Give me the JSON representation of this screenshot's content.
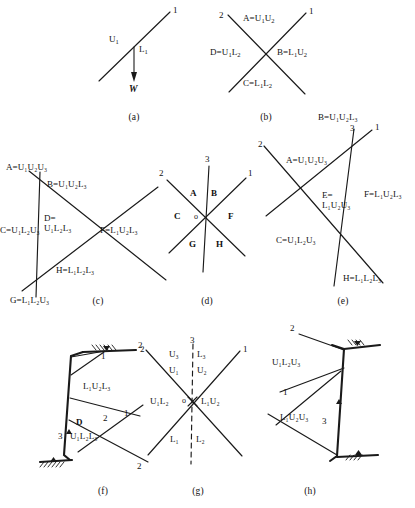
{
  "figure": {
    "stroke_color": "#1a1a1a",
    "background": "#ffffff",
    "panels": [
      {
        "id": "a",
        "caption": "(a)",
        "line_numbers": [
          "1"
        ],
        "labels": [
          "U1",
          "L1",
          "W"
        ]
      },
      {
        "id": "b",
        "caption": "(b)",
        "line_numbers": [
          "1",
          "2"
        ],
        "labels": [
          "A=U1U2",
          "B=L1U2",
          "C=L1L2",
          "D=U1L2"
        ]
      },
      {
        "id": "c",
        "caption": "(c)",
        "line_numbers": [],
        "labels": [
          "A=U1U2U3",
          "B=U1U2L3",
          "C=U1L2U3",
          "D= U1L2L3",
          "F=L1U2L3",
          "G=L1L2U3",
          "H=L1L2L3"
        ]
      },
      {
        "id": "d",
        "caption": "(d)",
        "line_numbers": [
          "1",
          "2",
          "3"
        ],
        "labels": [
          "o",
          "A",
          "B",
          "C",
          "F",
          "G",
          "H"
        ]
      },
      {
        "id": "e",
        "caption": "(e)",
        "line_numbers": [
          "1",
          "2",
          "3"
        ],
        "labels": [
          "A=U1U2U3",
          "B=U1U2L3",
          "C=U1L2U3",
          "E= L1U2U3",
          "F=L1U2L3",
          "H=L1L2L3"
        ]
      },
      {
        "id": "f",
        "caption": "(f)",
        "line_numbers": [
          "1",
          "2",
          "3",
          "1",
          "2",
          "2"
        ],
        "labels": [
          "L1U2L3",
          "D",
          "U1L2L3"
        ]
      },
      {
        "id": "g",
        "caption": "(g)",
        "line_numbers": [
          "1",
          "2",
          "3"
        ],
        "labels": [
          "o",
          "U3",
          "L3",
          "U1",
          "U2",
          "U1L2",
          "L1U2",
          "L1",
          "L2"
        ]
      },
      {
        "id": "h",
        "caption": "(h)",
        "line_numbers": [
          "1",
          "2",
          "3"
        ],
        "labels": [
          "U1L2U3",
          "L1U2U3"
        ]
      }
    ]
  },
  "panel_a": {
    "line1": "1",
    "u1": "U",
    "u1_sub": "1",
    "l1": "L",
    "l1_sub": "1",
    "weight": "W",
    "caption": "(a)"
  },
  "panel_b": {
    "line1": "1",
    "line2": "2",
    "region_a": "A=U",
    "region_a_s1": "1",
    "region_a_2": "U",
    "region_a_s2": "2",
    "region_b": "B=L",
    "region_b_s1": "1",
    "region_b_2": "U",
    "region_b_s2": "2",
    "region_c": "C=L",
    "region_c_s1": "1",
    "region_c_2": "L",
    "region_c_s2": "2",
    "region_d": "D=U",
    "region_d_s1": "1",
    "region_d_2": "L",
    "region_d_s2": "2",
    "caption": "(b)"
  },
  "panel_c": {
    "region_a": "A=U₁U₂U₃",
    "region_b": "B=U₁U₂L₃",
    "region_c": "C=U₁L₂U₃",
    "region_d_line1": "D=",
    "region_d_line2": "U₁L₂L₃",
    "region_f": "F=L₁U₂L₃",
    "region_g": "G=L₁L₂U₃",
    "region_h": "H=L₁L₂L₃",
    "caption": "(c)"
  },
  "panel_d": {
    "line1": "1",
    "line2": "2",
    "line3": "3",
    "origin": "o",
    "region_a": "A",
    "region_b": "B",
    "region_c": "C",
    "region_f": "F",
    "region_g": "G",
    "region_h": "H",
    "caption": "(d)"
  },
  "panel_e": {
    "line1": "1",
    "line2": "2",
    "line3": "3",
    "region_a": "A=U₁U₂U₃",
    "region_b": "B=U₁U₂L₃",
    "region_c": "C=U₁L₂U₃",
    "region_e_line1": "E=",
    "region_e_line2": "L₁U₂U₃",
    "region_f": "F=L₁U₂L₃",
    "region_h": "H=L₁L₂L₃",
    "caption": "(e)"
  },
  "panel_f": {
    "label_top": "L₁U₂L₃",
    "label_d": "D",
    "label_bottom": "U₁L₂L₃",
    "num_top_1": "1",
    "num_right_2": "2",
    "num_mid_2": "2",
    "num_mid_1": "1",
    "num_left_3": "3",
    "num_bottom_2": "2",
    "caption": "(f)"
  },
  "panel_g": {
    "line1": "1",
    "line2": "2",
    "line3": "3",
    "origin": "o",
    "u3": "U₃",
    "l3": "L₃",
    "u1": "U₁",
    "u2": "U₂",
    "u1l2": "U₁L₂",
    "l1u2": "L₁U₂",
    "l1": "L₁",
    "l2": "L₂",
    "caption": "(g)"
  },
  "panel_h": {
    "label_top": "U₁L₂U₃",
    "label_bottom": "L₁U₂U₃",
    "num_2": "2",
    "num_1": "1",
    "num_3": "3",
    "caption": "(h)"
  }
}
